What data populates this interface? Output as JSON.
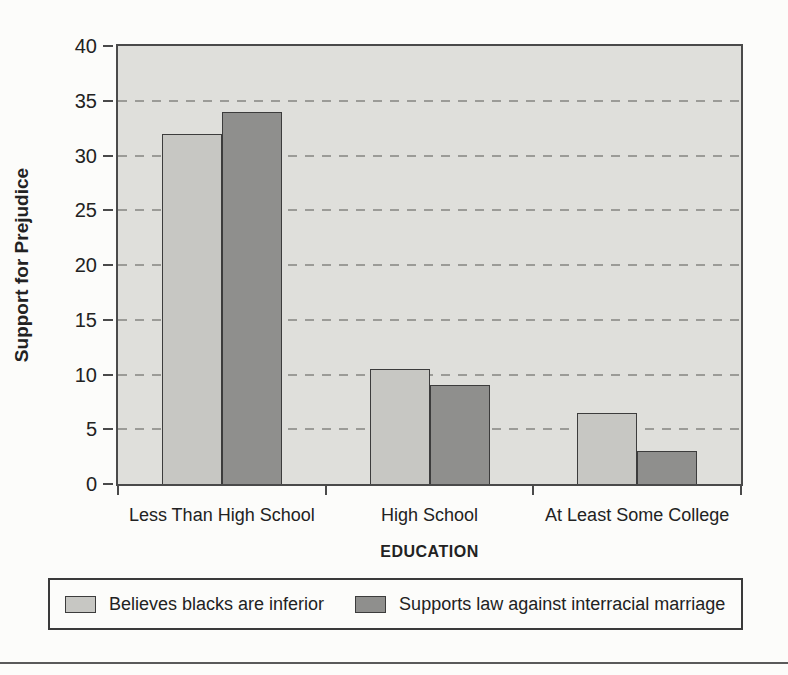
{
  "chart_data": {
    "type": "bar",
    "title": "",
    "categories": [
      "Less Than High School",
      "High School",
      "At Least Some College"
    ],
    "series": [
      {
        "name": "Believes blacks are inferior",
        "values": [
          32,
          10.5,
          6.5
        ],
        "color": "#c7c7c3"
      },
      {
        "name": "Supports law against interracial marriage",
        "values": [
          34,
          9,
          3
        ],
        "color": "#8f8f8d"
      }
    ],
    "xlabel": "EDUCATION",
    "ylabel": "Support for Prejudice",
    "ylim": [
      0,
      40
    ],
    "yticks": [
      0,
      5,
      10,
      15,
      20,
      25,
      30,
      35,
      40
    ],
    "grid": "horizontal-dashed",
    "legend_position": "bottom"
  },
  "colors": {
    "page_bg": "#fcfcfa",
    "plot_bg": "#dfdfdb",
    "grid": "#9b9b97",
    "axis_border": "#4a4a4a",
    "bar_border": "#3c3c3c",
    "text": "#222222",
    "legend_border": "#3a3a3a",
    "rule": "#5a5a5a"
  }
}
